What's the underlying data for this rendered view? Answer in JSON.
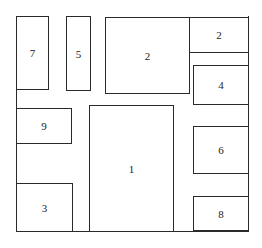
{
  "diagram": {
    "type": "floor-plan-layout",
    "frame": {
      "x": 16,
      "y": 16,
      "w": 233,
      "h": 216
    },
    "boxes": [
      {
        "label": "7",
        "x": 16,
        "y": 16,
        "w": 33,
        "h": 74
      },
      {
        "label": "5",
        "x": 66,
        "y": 16,
        "w": 25,
        "h": 75
      },
      {
        "label": "2",
        "x": 105,
        "y": 17,
        "w": 84,
        "h": 76
      },
      {
        "label": "2",
        "x": 189,
        "y": 17,
        "w": 60,
        "h": 36
      },
      {
        "label": "4",
        "x": 193,
        "y": 65,
        "w": 56,
        "h": 39
      },
      {
        "label": "9",
        "x": 16,
        "y": 108,
        "w": 56,
        "h": 35
      },
      {
        "label": "1",
        "x": 89,
        "y": 105,
        "w": 85,
        "h": 127
      },
      {
        "label": "6",
        "x": 193,
        "y": 126,
        "w": 56,
        "h": 47
      },
      {
        "label": "3",
        "x": 16,
        "y": 183,
        "w": 56,
        "h": 49
      },
      {
        "label": "8",
        "x": 193,
        "y": 196,
        "w": 56,
        "h": 35
      }
    ]
  }
}
